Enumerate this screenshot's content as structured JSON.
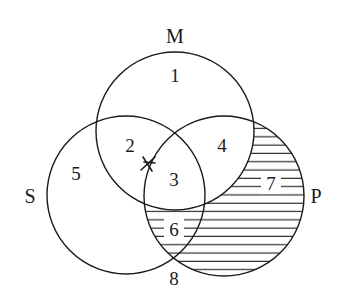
{
  "diagram": {
    "type": "venn",
    "sets": [
      {
        "id": "M",
        "label": "M",
        "cx": 175,
        "cy": 131,
        "r": 79
      },
      {
        "id": "S",
        "label": "S",
        "cx": 126,
        "cy": 195,
        "r": 79
      },
      {
        "id": "P",
        "label": "P",
        "cx": 224,
        "cy": 196,
        "r": 80
      }
    ],
    "set_labels": {
      "M": {
        "text": "M",
        "x": 175,
        "y": 43
      },
      "S": {
        "text": "S",
        "x": 30,
        "y": 203
      },
      "P": {
        "text": "P",
        "x": 316,
        "y": 203
      }
    },
    "regions": [
      {
        "n": "1",
        "x": 175,
        "y": 82
      },
      {
        "n": "2",
        "x": 130,
        "y": 152
      },
      {
        "n": "3",
        "x": 174,
        "y": 186
      },
      {
        "n": "4",
        "x": 222,
        "y": 152
      },
      {
        "n": "5",
        "x": 76,
        "y": 180
      },
      {
        "n": "6",
        "x": 174,
        "y": 234
      },
      {
        "n": "7",
        "x": 271,
        "y": 188
      },
      {
        "n": "8",
        "x": 174,
        "y": 283
      }
    ],
    "shaded": "P not M (regions 6 and 7)",
    "shading_style": "horizontal-lines",
    "mark": {
      "symbol": "X",
      "x": 148,
      "y": 164,
      "note": "X placed on boundary between regions 2 and 3"
    },
    "colors": {
      "stroke": "#1a1a1a",
      "background": "#ffffff"
    }
  }
}
